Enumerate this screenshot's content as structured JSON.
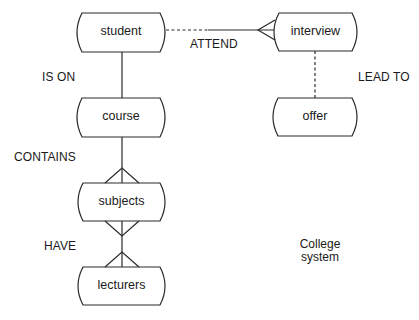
{
  "diagram": {
    "type": "entity-relationship",
    "entities": [
      {
        "id": "student",
        "label": "student"
      },
      {
        "id": "course",
        "label": "course"
      },
      {
        "id": "subjects",
        "label": "subjects"
      },
      {
        "id": "lecturers",
        "label": "lecturers"
      },
      {
        "id": "interview",
        "label": "interview"
      },
      {
        "id": "offer",
        "label": "offer"
      }
    ],
    "relationships": [
      {
        "label": "IS ON",
        "from": "student",
        "to": "course",
        "style": "solid",
        "cardinality": "one-to-one"
      },
      {
        "label": "CONTAINS",
        "from": "course",
        "to": "subjects",
        "style": "solid",
        "cardinality": "one-to-many"
      },
      {
        "label": "HAVE",
        "from": "subjects",
        "to": "lecturers",
        "style": "solid",
        "cardinality": "many-to-many"
      },
      {
        "label": "ATTEND",
        "from": "student",
        "to": "interview",
        "style": "dashed-then-solid",
        "cardinality": "one-to-many"
      },
      {
        "label": "LEAD TO",
        "from": "interview",
        "to": "offer",
        "style": "dashed",
        "cardinality": "one-to-one"
      }
    ],
    "note": "College system",
    "colors": {
      "line": "#2a2a2a",
      "text": "#1a1a1a",
      "background": "#ffffff"
    }
  }
}
